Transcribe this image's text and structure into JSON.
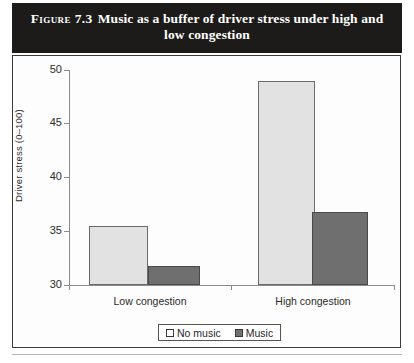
{
  "figure": {
    "label": "Figure 7.3",
    "title": "Music as a buffer of driver stress under high and low congestion"
  },
  "legend": {
    "entries": [
      {
        "label": "No music",
        "swatch": "light-grey-swatch",
        "color": "#e2e2e2"
      },
      {
        "label": "Music",
        "swatch": "dark-grey-swatch",
        "color": "#6f6f6f"
      }
    ]
  },
  "axis": {
    "y_title": "Driver stress (0–100)",
    "y_ticks": [
      "50",
      "45",
      "40",
      "35",
      "30"
    ],
    "x_categories": [
      "Low congestion",
      "High congestion"
    ]
  },
  "chart_data": {
    "type": "bar",
    "title": "Music as a buffer of driver stress under high and low congestion",
    "xlabel": "",
    "ylabel": "Driver stress (0–100)",
    "ylim": [
      30,
      50
    ],
    "yticks": [
      30,
      35,
      40,
      45,
      50
    ],
    "grid": false,
    "legend_position": "bottom-center",
    "categories": [
      "Low congestion",
      "High congestion"
    ],
    "series": [
      {
        "name": "No music",
        "color": "#e2e2e2",
        "values": [
          35.5,
          49.0
        ]
      },
      {
        "name": "Music",
        "color": "#6f6f6f",
        "values": [
          31.8,
          36.8
        ]
      }
    ]
  }
}
